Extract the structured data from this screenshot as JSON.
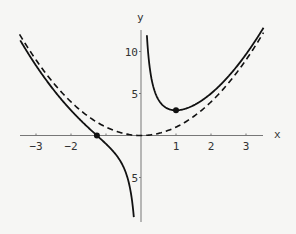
{
  "chart_data": {
    "type": "line",
    "title": "",
    "xlabel": "x",
    "ylabel": "y",
    "xlim": [
      -3.5,
      3.5
    ],
    "ylim": [
      -10,
      12
    ],
    "grid": false,
    "legend": null,
    "x_ticks": [
      -3,
      -2,
      -1,
      1,
      2,
      3
    ],
    "x_tick_labels": [
      "-3",
      "-2",
      "",
      "1",
      "2",
      "3"
    ],
    "y_ticks": [
      -5,
      5,
      10
    ],
    "y_tick_labels": [
      "-5",
      "5",
      "10"
    ],
    "series": [
      {
        "name": "f(x) = x^2 + 2/x",
        "style": "solid",
        "color": "#111111",
        "x": [
          -3.5,
          -3,
          -2.5,
          -2,
          -1.5,
          -1.26,
          -1,
          -0.75,
          -0.5,
          -0.35,
          -0.25,
          0.18,
          0.25,
          0.5,
          0.75,
          1,
          1.5,
          2,
          2.5,
          3,
          3.5
        ],
        "y": [
          11.68,
          8.33,
          5.45,
          3.0,
          0.92,
          0.0,
          -1.0,
          -2.1,
          -3.75,
          -5.59,
          -7.94,
          11.14,
          8.06,
          4.25,
          3.23,
          3.0,
          3.58,
          5.0,
          7.05,
          9.67,
          12.82
        ]
      },
      {
        "name": "g(x) = x^2",
        "style": "dashed",
        "color": "#111111",
        "x": [
          -3.5,
          -3,
          -2,
          -1,
          0,
          1,
          2,
          3,
          3.5
        ],
        "y": [
          12.25,
          9,
          4,
          1,
          0,
          1,
          4,
          9,
          12.25
        ]
      }
    ],
    "annotations": [
      {
        "type": "point",
        "x": -1.26,
        "y": 0,
        "label": "zero of f"
      },
      {
        "type": "point",
        "x": 1,
        "y": 3,
        "label": "local minimum of f"
      }
    ]
  }
}
